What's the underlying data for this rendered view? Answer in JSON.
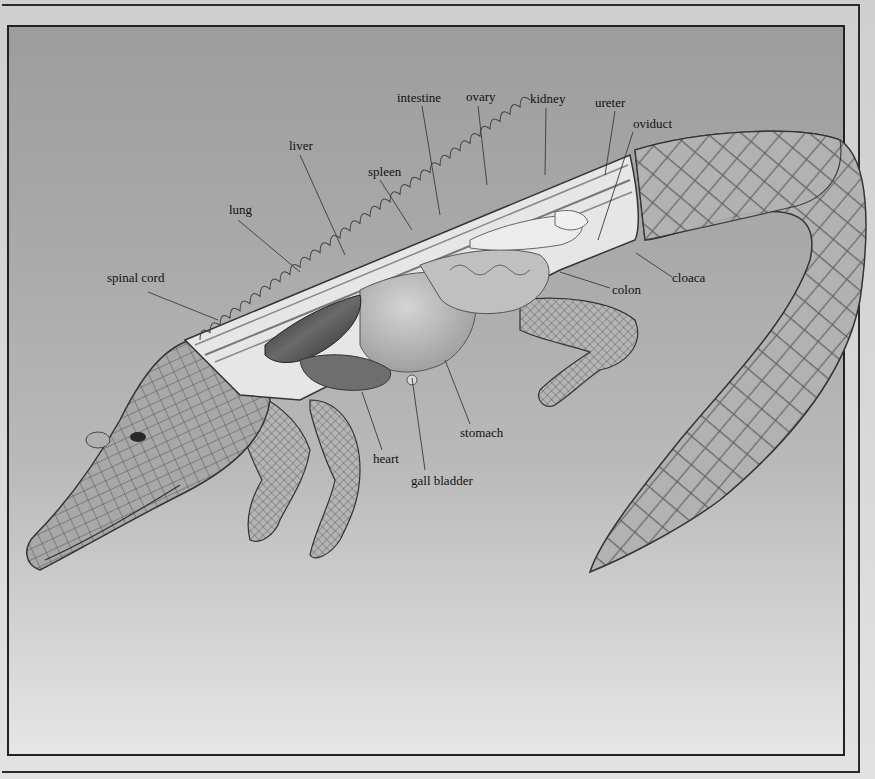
{
  "diagram": {
    "labels": [
      {
        "id": "intestine",
        "text": "intestine",
        "x": 397,
        "y": 91,
        "line": [
          422,
          106,
          440,
          215
        ]
      },
      {
        "id": "ovary",
        "text": "ovary",
        "x": 466,
        "y": 90,
        "line": [
          478,
          106,
          487,
          185
        ]
      },
      {
        "id": "kidney",
        "text": "kidney",
        "x": 530,
        "y": 92,
        "line": [
          546,
          108,
          545,
          175
        ]
      },
      {
        "id": "ureter",
        "text": "ureter",
        "x": 595,
        "y": 96,
        "line": [
          615,
          111,
          605,
          175
        ]
      },
      {
        "id": "oviduct",
        "text": "oviduct",
        "x": 633,
        "y": 117,
        "line": [
          633,
          132,
          598,
          240
        ]
      },
      {
        "id": "liver",
        "text": "liver",
        "x": 289,
        "y": 139,
        "line": [
          300,
          155,
          345,
          255
        ]
      },
      {
        "id": "spleen",
        "text": "spleen",
        "x": 368,
        "y": 165,
        "line": [
          380,
          180,
          412,
          230
        ]
      },
      {
        "id": "lung",
        "text": "lung",
        "x": 229,
        "y": 203,
        "line": [
          238,
          220,
          300,
          272
        ]
      },
      {
        "id": "spinal-cord",
        "text": "spinal cord",
        "x": 107,
        "y": 271,
        "line": [
          148,
          292,
          218,
          320
        ]
      },
      {
        "id": "cloaca",
        "text": "cloaca",
        "x": 672,
        "y": 271,
        "line": [
          672,
          277,
          636,
          253
        ]
      },
      {
        "id": "colon",
        "text": "colon",
        "x": 612,
        "y": 283,
        "line": [
          610,
          288,
          560,
          272
        ]
      },
      {
        "id": "stomach",
        "text": "stomach",
        "x": 460,
        "y": 426,
        "line": [
          470,
          424,
          445,
          360
        ]
      },
      {
        "id": "heart",
        "text": "heart",
        "x": 373,
        "y": 452,
        "line": [
          382,
          450,
          362,
          392
        ]
      },
      {
        "id": "gall-bladder",
        "text": "gall bladder",
        "x": 411,
        "y": 474,
        "line": [
          425,
          470,
          412,
          378
        ]
      }
    ],
    "colors": {
      "background_top": "#9d9d9d",
      "background_bottom": "#e6e6e6",
      "frame": "#222222",
      "label_text": "#111111",
      "leader_line": "#3a3a3a",
      "skin": "#8a8a8a",
      "skin_light": "#c4c4c4",
      "section_cut": "#e4e4e4",
      "organs": "#b8b8b8",
      "lung": "#2e2e2e"
    }
  }
}
